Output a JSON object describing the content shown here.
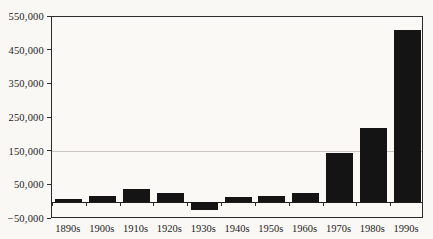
{
  "chart_data": {
    "type": "bar",
    "title": "",
    "xlabel": "",
    "ylabel": "",
    "categories": [
      "1890s",
      "1900s",
      "1910s",
      "1920s",
      "1930s",
      "1940s",
      "1950s",
      "1960s",
      "1970s",
      "1980s",
      "1990s"
    ],
    "values": [
      10000,
      18000,
      38000,
      27000,
      -22000,
      14000,
      18000,
      26000,
      145000,
      220000,
      510000
    ],
    "ylim": [
      -50000,
      550000
    ],
    "yticks": [
      {
        "value": 550000,
        "label": "550,000"
      },
      {
        "value": 450000,
        "label": "450,000"
      },
      {
        "value": 350000,
        "label": "350,000"
      },
      {
        "value": 250000,
        "label": "250,000"
      },
      {
        "value": 150000,
        "label": "150,000"
      },
      {
        "value": 50000,
        "label": "50,000"
      },
      {
        "value": -50000,
        "label": "−50,000"
      }
    ],
    "gridline_values": [
      150000
    ],
    "legend": "none",
    "grid": "single horizontal gridline at 150,000; plot area framed on all four sides; category axis drawn at zero with tick marks between categories",
    "bar_color": "#141414",
    "frame_color": "#2b2b2b",
    "background_color": "#faf8f5"
  }
}
